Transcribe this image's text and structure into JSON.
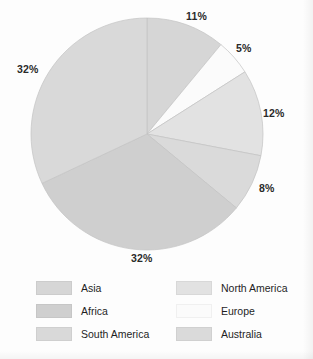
{
  "chart_data": {
    "type": "pie",
    "title": "",
    "categories": [
      "Asia",
      "Europe",
      "North America",
      "Australia",
      "Africa",
      "South America"
    ],
    "values": [
      11,
      5,
      12,
      8,
      32,
      32
    ],
    "value_unit": "%",
    "legend_position": "bottom",
    "grid": false,
    "slices": [
      {
        "label": "Asia",
        "value": 11,
        "display": "11%",
        "color": "#d6d6d6",
        "start_angle": 0,
        "end_angle": 39.6
      },
      {
        "label": "Europe",
        "value": 5,
        "display": "5%",
        "color": "#fbfbfb",
        "start_angle": 39.6,
        "end_angle": 57.6
      },
      {
        "label": "North America",
        "value": 12,
        "display": "12%",
        "color": "#e2e2e2",
        "start_angle": 57.6,
        "end_angle": 100.8
      },
      {
        "label": "Australia",
        "value": 8,
        "display": "8%",
        "color": "#dadada",
        "start_angle": 100.8,
        "end_angle": 129.6
      },
      {
        "label": "Africa",
        "value": 32,
        "display": "32%",
        "color": "#cfcfcf",
        "start_angle": 129.6,
        "end_angle": 244.8
      },
      {
        "label": "South America",
        "value": 32,
        "display": "32%",
        "color": "#d9d9d9",
        "start_angle": 244.8,
        "end_angle": 360
      }
    ]
  },
  "labels": {
    "top": "11%",
    "upper_right": "5%",
    "right": "12%",
    "lower_right": "8%",
    "bottom": "32%",
    "left": "32%"
  },
  "legend": {
    "entries": [
      {
        "label": "Asia",
        "color": "#d6d6d6"
      },
      {
        "label": "North America",
        "color": "#e2e2e2"
      },
      {
        "label": "Africa",
        "color": "#cfcfcf"
      },
      {
        "label": "Europe",
        "color": "#fbfbfb"
      },
      {
        "label": "South America",
        "color": "#d9d9d9"
      },
      {
        "label": "Australia",
        "color": "#dadada"
      }
    ]
  },
  "colors": {
    "background": "#fdfdfd",
    "text": "#1f1f1f",
    "slice_outline": "#c3c3c3"
  }
}
